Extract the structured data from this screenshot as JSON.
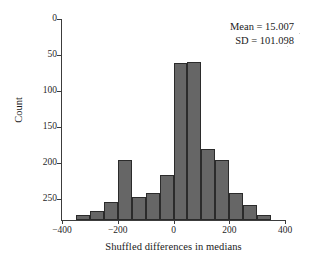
{
  "chart_data": {
    "type": "bar",
    "title": "",
    "subtitle": "",
    "xlabel": "Shuffled differences in medians",
    "ylabel": "Count",
    "xlim": [
      -400,
      400
    ],
    "ylim": [
      0,
      279
    ],
    "y_axis_inverted": true,
    "grid": false,
    "legend": null,
    "bar_color": "#666666",
    "bar_edge_color": "#2b2b2b",
    "xticks": [
      -400,
      -200,
      0,
      200,
      400
    ],
    "xtick_labels": [
      "−400",
      "−200",
      "0",
      "200",
      "400"
    ],
    "yticks": [
      0,
      50,
      100,
      150,
      200,
      250
    ],
    "ytick_labels": [
      "0",
      "50",
      "100",
      "150",
      "200",
      "250"
    ],
    "bin_width": 50,
    "bin_left_edges": [
      -350,
      -300,
      -250,
      -200,
      -150,
      -100,
      -50,
      0,
      50,
      100,
      150,
      200,
      250
    ],
    "bin_centers": [
      -325,
      -275,
      -225,
      -175,
      -125,
      -75,
      -25,
      25,
      75,
      125,
      175,
      225,
      275
    ],
    "values": [
      272,
      266,
      254,
      196,
      247,
      241,
      216,
      61,
      60,
      181,
      196,
      242,
      258,
      272
    ],
    "bars": [
      {
        "left": -350,
        "right": -300,
        "center": -325,
        "count": 272
      },
      {
        "left": -300,
        "right": -250,
        "center": -275,
        "count": 266
      },
      {
        "left": -250,
        "right": -200,
        "center": -225,
        "count": 254
      },
      {
        "left": -200,
        "right": -150,
        "center": -175,
        "count": 196
      },
      {
        "left": -150,
        "right": -100,
        "center": -125,
        "count": 247
      },
      {
        "left": -100,
        "right": -50,
        "center": -75,
        "count": 241
      },
      {
        "left": -50,
        "right": 0,
        "center": -25,
        "count": 216
      },
      {
        "left": 0,
        "right": 50,
        "center": 25,
        "count": 61
      },
      {
        "left": 50,
        "right": 100,
        "center": 75,
        "count": 60
      },
      {
        "left": 100,
        "right": 150,
        "center": 125,
        "count": 181
      },
      {
        "left": 150,
        "right": 200,
        "center": 175,
        "count": 196
      },
      {
        "left": 200,
        "right": 250,
        "center": 225,
        "count": 242
      },
      {
        "left": 250,
        "right": 300,
        "center": 275,
        "count": 258
      },
      {
        "left": 300,
        "right": 350,
        "center": 325,
        "count": 272
      }
    ],
    "annotations": [
      {
        "name": "mean",
        "text": "Mean = 15.007",
        "value": 15.007
      },
      {
        "name": "sd",
        "text": "SD = 101.098",
        "value": 101.098
      }
    ]
  },
  "stats": {
    "mean_text": "Mean = 15.007",
    "sd_text": "SD = 101.098"
  }
}
